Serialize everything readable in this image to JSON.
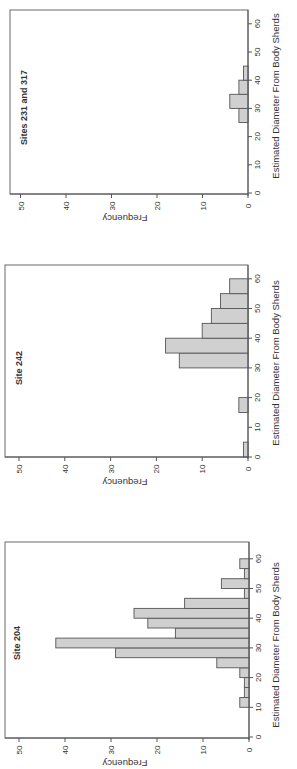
{
  "figure": {
    "orientation": "rotated 90 degrees (text reads bottom-to-top)",
    "bar_color": "#d0d0d0",
    "edge_color": "#555555"
  },
  "chart_data": [
    {
      "type": "bar",
      "title": "Sites 231 and 317",
      "xlabel": "Estimated Diameter From Body Sherds",
      "ylabel": "Frequency",
      "x_ticks": [
        0,
        10,
        20,
        30,
        40,
        50,
        60
      ],
      "y_ticks": [
        0,
        10,
        20,
        30,
        40,
        50
      ],
      "xlim": [
        0,
        65
      ],
      "ylim": [
        0,
        52
      ],
      "grid": false,
      "bins": [
        {
          "start": 25,
          "end": 30,
          "count": 2
        },
        {
          "start": 30,
          "end": 35,
          "count": 4
        },
        {
          "start": 35,
          "end": 40,
          "count": 2
        },
        {
          "start": 40,
          "end": 45,
          "count": 1
        }
      ]
    },
    {
      "type": "bar",
      "title": "Site 242",
      "xlabel": "Estimated Diameter From Body Sherds",
      "ylabel": "Frequency",
      "x_ticks": [
        0,
        10,
        20,
        30,
        40,
        50,
        60
      ],
      "y_ticks": [
        0,
        10,
        20,
        30,
        40,
        50
      ],
      "xlim": [
        0,
        65
      ],
      "ylim": [
        0,
        52
      ],
      "grid": false,
      "bins": [
        {
          "start": 0,
          "end": 5,
          "count": 1
        },
        {
          "start": 15,
          "end": 20,
          "count": 2
        },
        {
          "start": 30,
          "end": 35,
          "count": 15
        },
        {
          "start": 35,
          "end": 40,
          "count": 18
        },
        {
          "start": 40,
          "end": 45,
          "count": 10
        },
        {
          "start": 45,
          "end": 50,
          "count": 8
        },
        {
          "start": 50,
          "end": 55,
          "count": 6
        },
        {
          "start": 55,
          "end": 60,
          "count": 4
        }
      ]
    },
    {
      "type": "bar",
      "title": "Site 204",
      "xlabel": "Estimated Diameter From Body Sherds",
      "ylabel": "Frequency",
      "x_ticks": [
        0,
        10,
        20,
        30,
        40,
        50,
        60
      ],
      "y_ticks": [
        0,
        10,
        20,
        30,
        40,
        50
      ],
      "xlim": [
        0,
        65
      ],
      "ylim": [
        0,
        52
      ],
      "grid": false,
      "bins": [
        {
          "start": 10.0,
          "end": 13.3,
          "count": 2
        },
        {
          "start": 13.3,
          "end": 16.7,
          "count": 1
        },
        {
          "start": 16.7,
          "end": 20.0,
          "count": 1
        },
        {
          "start": 20.0,
          "end": 23.3,
          "count": 2
        },
        {
          "start": 23.3,
          "end": 26.7,
          "count": 7
        },
        {
          "start": 26.7,
          "end": 30.0,
          "count": 29
        },
        {
          "start": 30.0,
          "end": 33.3,
          "count": 42
        },
        {
          "start": 33.3,
          "end": 36.7,
          "count": 16
        },
        {
          "start": 36.7,
          "end": 40.0,
          "count": 22
        },
        {
          "start": 40.0,
          "end": 43.3,
          "count": 25
        },
        {
          "start": 43.3,
          "end": 46.7,
          "count": 14
        },
        {
          "start": 46.7,
          "end": 50.0,
          "count": 1
        },
        {
          "start": 50.0,
          "end": 53.3,
          "count": 6
        },
        {
          "start": 53.3,
          "end": 56.7,
          "count": 1
        },
        {
          "start": 56.7,
          "end": 60.0,
          "count": 2
        }
      ]
    }
  ]
}
